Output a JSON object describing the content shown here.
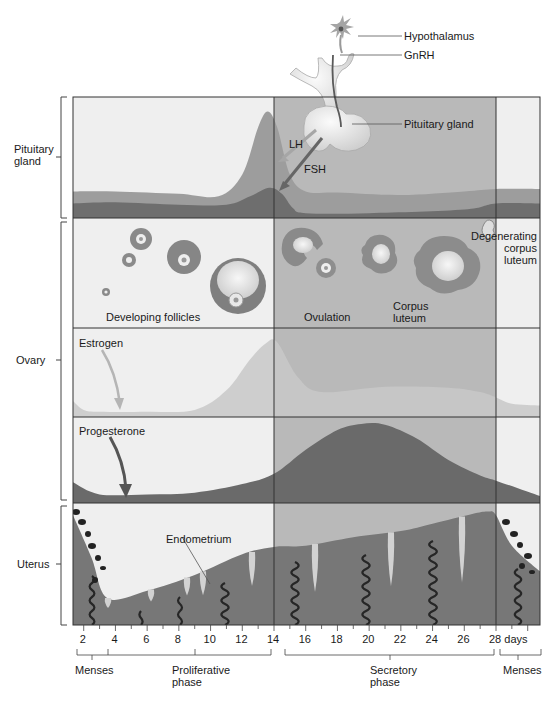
{
  "title_labels": {
    "hypothalamus": "Hypothalamus",
    "gnrh": "GnRH",
    "pituitary_gland_pointer": "Pituitary gland",
    "lh": "LH",
    "fsh": "FSH"
  },
  "rows": {
    "pituitary": {
      "label_line1": "Pituitary",
      "label_line2": "gland"
    },
    "ovary": {
      "label": "Ovary"
    },
    "uterus": {
      "label": "Uterus"
    }
  },
  "ovary_labels": {
    "developing_follicles": "Developing follicles",
    "ovulation": "Ovulation",
    "corpus_luteum_line1": "Corpus",
    "corpus_luteum_line2": "luteum",
    "degenerating_line1": "Degenerating",
    "degenerating_line2": "corpus",
    "degenerating_line3": "luteum",
    "estrogen": "Estrogen",
    "progesterone": "Progesterone"
  },
  "uterus_labels": {
    "endometrium": "Endometrium"
  },
  "axis": {
    "ticks": [
      "2",
      "4",
      "6",
      "8",
      "10",
      "12",
      "14",
      "16",
      "18",
      "20",
      "22",
      "24",
      "26",
      "28 days"
    ]
  },
  "phases": {
    "menses_start": "Menses",
    "proliferative_line1": "Proliferative",
    "proliferative_line2": "phase",
    "secretory_line1": "Secretory",
    "secretory_line2": "phase",
    "menses_end": "Menses"
  },
  "colors": {
    "background_light": "#efefef",
    "secretory_band": "#b9b9b9",
    "lh_fill": "#9d9d9d",
    "fsh_fill": "#6e6e6e",
    "estrogen_fill": "#c8c8c8",
    "progesterone_fill": "#6a6a6a",
    "endometrium_fill": "#777777",
    "artery": "#2a2a2a",
    "gland": "#d6d6d6",
    "border": "#333333"
  },
  "chart_data": {
    "type": "area",
    "xlabel": "days",
    "x_range": [
      1.3,
      30.7
    ],
    "phase_boundaries_days": [
      14,
      28
    ],
    "series": [
      {
        "name": "LH",
        "panel": "Pituitary gland",
        "x": [
          1.3,
          4,
          8,
          10.5,
          12,
          13,
          13.6,
          14.2,
          15,
          16,
          18,
          22,
          26,
          28,
          30.7
        ],
        "y": [
          0.22,
          0.22,
          0.2,
          0.18,
          0.36,
          0.75,
          0.88,
          0.75,
          0.36,
          0.22,
          0.21,
          0.19,
          0.22,
          0.24,
          0.24
        ]
      },
      {
        "name": "FSH",
        "panel": "Pituitary gland",
        "x": [
          1.3,
          4,
          8,
          11,
          12.5,
          13.7,
          14.5,
          15.2,
          16,
          20,
          26,
          28,
          30.7
        ],
        "y": [
          0.12,
          0.13,
          0.11,
          0.11,
          0.18,
          0.25,
          0.2,
          0.08,
          0.04,
          0.04,
          0.07,
          0.12,
          0.12
        ]
      },
      {
        "name": "Estrogen",
        "panel": "Ovary",
        "x": [
          1.3,
          2,
          3,
          6,
          9,
          11,
          12.5,
          13.5,
          14.2,
          15.5,
          17,
          21,
          25,
          27,
          28,
          29,
          30.7
        ],
        "y": [
          0.18,
          0.08,
          0.06,
          0.06,
          0.08,
          0.3,
          0.65,
          0.83,
          0.84,
          0.45,
          0.28,
          0.34,
          0.33,
          0.28,
          0.22,
          0.15,
          0.13
        ]
      },
      {
        "name": "Progesterone",
        "panel": "Ovary",
        "x": [
          1.3,
          3,
          6,
          9,
          12,
          14,
          16,
          18,
          19.5,
          21,
          23,
          25,
          27,
          28,
          30.7
        ],
        "y": [
          0.24,
          0.1,
          0.1,
          0.12,
          0.22,
          0.34,
          0.62,
          0.85,
          0.92,
          0.91,
          0.75,
          0.5,
          0.32,
          0.26,
          0.08
        ]
      },
      {
        "name": "Endometrium thickness",
        "panel": "Uterus",
        "x": [
          1.3,
          2.5,
          3.5,
          6,
          9,
          12,
          14,
          16,
          19,
          22,
          24,
          26.5,
          27.5,
          28,
          29,
          30.7
        ],
        "y": [
          0.9,
          0.55,
          0.22,
          0.28,
          0.41,
          0.58,
          0.64,
          0.65,
          0.72,
          0.77,
          0.83,
          0.91,
          0.93,
          0.9,
          0.65,
          0.44
        ]
      }
    ]
  }
}
